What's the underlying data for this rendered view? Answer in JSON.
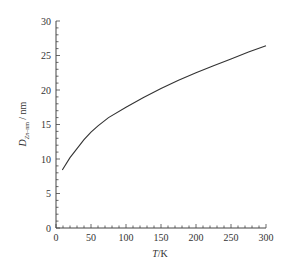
{
  "chart_data": {
    "type": "line",
    "title": "",
    "xlabel": "T/K",
    "ylabel": "D_{Zn-nm} / nm",
    "xlim": [
      0,
      300
    ],
    "ylim": [
      0,
      30
    ],
    "xticks": [
      0,
      50,
      100,
      150,
      200,
      250,
      300
    ],
    "yticks": [
      0,
      5,
      10,
      15,
      20,
      25,
      30
    ],
    "grid": false,
    "legend": null,
    "series": [
      {
        "name": "D",
        "x": [
          9,
          20,
          30,
          40,
          50,
          60,
          75,
          100,
          125,
          150,
          175,
          200,
          225,
          250,
          275,
          300
        ],
        "y": [
          8.4,
          10.2,
          11.5,
          12.8,
          13.9,
          14.8,
          16.0,
          17.5,
          18.9,
          20.2,
          21.4,
          22.5,
          23.5,
          24.5,
          25.5,
          26.4
        ]
      }
    ],
    "line_color": "#333333"
  }
}
